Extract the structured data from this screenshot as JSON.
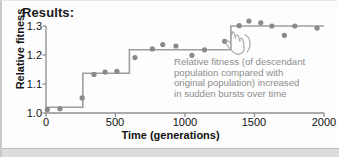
{
  "title": "Results:",
  "annotation": "Relative fitness (of descendant\npopulation compared with\noriginal population) increased\nin sudden bursts over time",
  "icons": {
    "pointing_hand": "pointing-hand-icon"
  },
  "colors": {
    "marker": "#8a8a8a",
    "step_line": "#9e9e9e",
    "axis": "#8f8f8f",
    "text": "#111111",
    "annotation_text": "#8d8d8d",
    "background": "#fdfdfd",
    "bottom_band": "#dcdcdc"
  },
  "chart_data": {
    "type": "scatter",
    "title": "Results:",
    "xlabel": "Time (generations)",
    "ylabel": "Relative fitness",
    "xlim": [
      0,
      2000
    ],
    "ylim": [
      1.0,
      1.3
    ],
    "xticks": [
      0,
      500,
      1000,
      1500,
      2000
    ],
    "xtick_labels": [
      "0",
      "500",
      "1000",
      "1500",
      "2000"
    ],
    "yticks": [
      1.0,
      1.1,
      1.2,
      1.3
    ],
    "ytick_labels": [
      "1.0",
      "1.1",
      "1.2",
      "1.3"
    ],
    "grid": false,
    "legend": false,
    "series": [
      {
        "name": "Relative fitness measurements",
        "marker": "filled-circle",
        "x": [
          10,
          100,
          260,
          345,
          425,
          510,
          640,
          765,
          840,
          935,
          1050,
          1140,
          1285,
          1390,
          1460,
          1545,
          1625,
          1715,
          1790,
          1950
        ],
        "y": [
          1.012,
          1.015,
          1.052,
          1.133,
          1.141,
          1.144,
          1.191,
          1.221,
          1.236,
          1.231,
          1.199,
          1.218,
          1.247,
          1.301,
          1.317,
          1.311,
          1.3,
          1.268,
          1.3,
          1.293
        ]
      },
      {
        "name": "Step function fit",
        "marker": "none",
        "style": "step-post",
        "x": [
          0,
          265,
          265,
          600,
          600,
          1330,
          1330,
          2000
        ],
        "y": [
          1.02,
          1.02,
          1.137,
          1.137,
          1.218,
          1.218,
          1.3,
          1.3
        ]
      }
    ],
    "annotations": [
      {
        "text": "Relative fitness (of descendant population compared with original population) increased in sudden bursts over time",
        "x": 1000,
        "y": 1.12
      }
    ]
  }
}
